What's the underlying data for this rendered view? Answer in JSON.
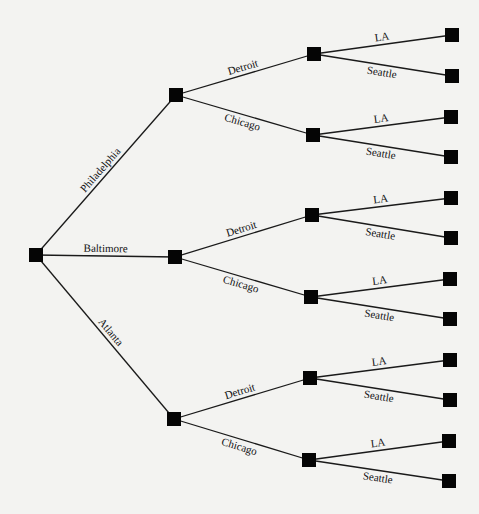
{
  "diagram": {
    "type": "decision-tree",
    "root": {
      "id": "root",
      "x": 36,
      "y": 255
    },
    "level1": [
      {
        "id": "philadelphia",
        "label": "Philadelphia",
        "x": 176,
        "y": 95
      },
      {
        "id": "baltimore",
        "label": "Baltimore",
        "x": 175,
        "y": 257
      },
      {
        "id": "atlanta",
        "label": "Atlanta",
        "x": 174,
        "y": 419
      }
    ],
    "level2": [
      {
        "parent": "philadelphia",
        "label": "Detroit",
        "x": 314,
        "y": 54
      },
      {
        "parent": "philadelphia",
        "label": "Chicago",
        "x": 313,
        "y": 135
      },
      {
        "parent": "baltimore",
        "label": "Detroit",
        "x": 312,
        "y": 215
      },
      {
        "parent": "baltimore",
        "label": "Chicago",
        "x": 311,
        "y": 297
      },
      {
        "parent": "atlanta",
        "label": "Detroit",
        "x": 310,
        "y": 378
      },
      {
        "parent": "atlanta",
        "label": "Chicago",
        "x": 309,
        "y": 460
      }
    ],
    "leaves": [
      {
        "label": "LA",
        "x": 452,
        "y": 35
      },
      {
        "label": "Seattle",
        "x": 452,
        "y": 76
      },
      {
        "label": "LA",
        "x": 451,
        "y": 117
      },
      {
        "label": "Seattle",
        "x": 451,
        "y": 157
      },
      {
        "label": "LA",
        "x": 451,
        "y": 198
      },
      {
        "label": "Seattle",
        "x": 451,
        "y": 238
      },
      {
        "label": "LA",
        "x": 450,
        "y": 279
      },
      {
        "label": "Seattle",
        "x": 450,
        "y": 319
      },
      {
        "label": "LA",
        "x": 450,
        "y": 360
      },
      {
        "label": "Seattle",
        "x": 450,
        "y": 400
      },
      {
        "label": "LA",
        "x": 449,
        "y": 441
      },
      {
        "label": "Seattle",
        "x": 449,
        "y": 481
      }
    ]
  }
}
